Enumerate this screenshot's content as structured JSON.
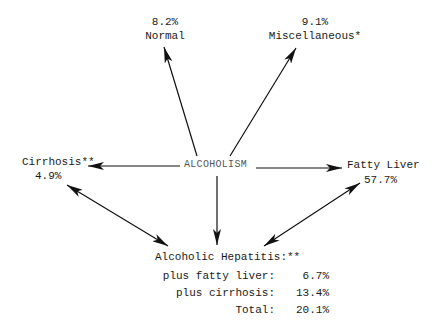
{
  "diagram": {
    "root": "ALCOHOLISM",
    "nodes": {
      "normal": {
        "label": "Normal",
        "value": "8.2%"
      },
      "misc": {
        "label": "Miscellaneous*",
        "value": "9.1%"
      },
      "cirrhosis": {
        "label": "Cirrhosis**",
        "value": "4.9%"
      },
      "fatty": {
        "label": "Fatty Liver",
        "value": "57.7%"
      },
      "hepatitis": {
        "label": "Alcoholic Hepatitis:**",
        "rows": [
          {
            "label": "plus fatty liver:",
            "value": "6.7%"
          },
          {
            "label": "plus cirrhosis:",
            "value": "13.4%"
          },
          {
            "label": "Total:",
            "value": "20.1%"
          }
        ]
      }
    },
    "edges": [
      {
        "from": "ALCOHOLISM",
        "to": "Normal",
        "type": "one-way"
      },
      {
        "from": "ALCOHOLISM",
        "to": "Miscellaneous*",
        "type": "one-way"
      },
      {
        "from": "ALCOHOLISM",
        "to": "Cirrhosis**",
        "type": "one-way"
      },
      {
        "from": "ALCOHOLISM",
        "to": "Fatty Liver",
        "type": "one-way"
      },
      {
        "from": "ALCOHOLISM",
        "to": "Alcoholic Hepatitis",
        "type": "one-way"
      },
      {
        "from": "Cirrhosis**",
        "to": "Alcoholic Hepatitis",
        "type": "two-way"
      },
      {
        "from": "Fatty Liver",
        "to": "Alcoholic Hepatitis",
        "type": "two-way"
      }
    ]
  }
}
